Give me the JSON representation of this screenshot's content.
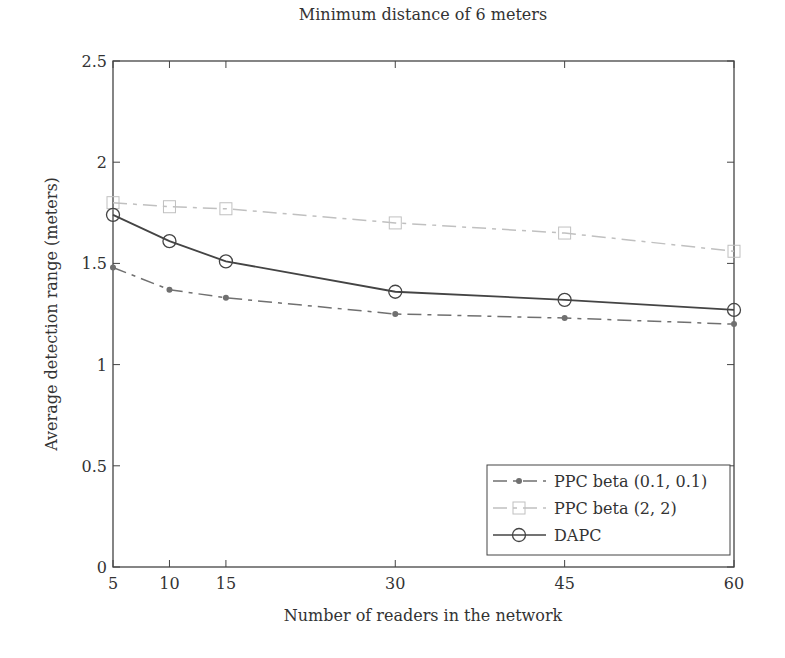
{
  "chart_data": {
    "type": "line",
    "title": "Minimum distance of 6 meters",
    "xlabel": "Number of readers in the network",
    "ylabel": "Average detection range (meters)",
    "x": [
      5,
      10,
      15,
      30,
      45,
      60
    ],
    "xticks": [
      "5",
      "10",
      "15",
      "30",
      "45",
      "60"
    ],
    "yticks": [
      "0",
      "0.5",
      "1",
      "1.5",
      "2",
      "2.5"
    ],
    "xlim": [
      5,
      60
    ],
    "ylim": [
      0,
      2.5
    ],
    "grid": false,
    "legend_position": "lower right",
    "series": [
      {
        "name": "PPC beta (0.1, 0.1)",
        "values": [
          1.48,
          1.37,
          1.33,
          1.25,
          1.23,
          1.2
        ],
        "color": "#707070",
        "linestyle": "dashdot",
        "marker": "dot"
      },
      {
        "name": "PPC beta (2, 2)",
        "values": [
          1.8,
          1.78,
          1.77,
          1.7,
          1.65,
          1.56
        ],
        "color": "#c0c0c0",
        "linestyle": "dashdot",
        "marker": "square"
      },
      {
        "name": "DAPC",
        "values": [
          1.74,
          1.61,
          1.51,
          1.36,
          1.32,
          1.27
        ],
        "color": "#444444",
        "linestyle": "solid",
        "marker": "circle"
      }
    ]
  }
}
